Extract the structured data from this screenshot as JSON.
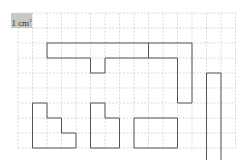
{
  "diagram": {
    "unit_label": {
      "text": "1 cm",
      "superscript": "2"
    },
    "grid": {
      "origin_x": 18,
      "origin_y": 13,
      "cell_w": 14.5,
      "cell_h": 15,
      "cols": 15,
      "rows": 9,
      "line_color": "#d0d0d0",
      "line_style": "dashed"
    },
    "shape_stroke": "#555555",
    "shapes": [
      {
        "name": "t-shape",
        "points": [
          [
            2,
            2
          ],
          [
            9,
            2
          ],
          [
            9,
            3
          ],
          [
            6,
            3
          ],
          [
            6,
            4
          ],
          [
            5,
            4
          ],
          [
            5,
            3
          ],
          [
            2,
            3
          ]
        ]
      },
      {
        "name": "l-shape-top-right",
        "points": [
          [
            9,
            2
          ],
          [
            12,
            2
          ],
          [
            12,
            6
          ],
          [
            11,
            6
          ],
          [
            11,
            3
          ],
          [
            9,
            3
          ]
        ]
      },
      {
        "name": "vertical-bar",
        "points": [
          [
            13,
            4
          ],
          [
            14,
            4
          ],
          [
            14,
            10
          ],
          [
            13,
            10
          ]
        ]
      },
      {
        "name": "staircase-left",
        "points": [
          [
            1,
            6
          ],
          [
            2,
            6
          ],
          [
            2,
            7
          ],
          [
            3,
            7
          ],
          [
            3,
            8
          ],
          [
            4,
            8
          ],
          [
            4,
            9
          ],
          [
            1,
            9
          ]
        ]
      },
      {
        "name": "step-shape",
        "points": [
          [
            5,
            6
          ],
          [
            6,
            6
          ],
          [
            6,
            7
          ],
          [
            7,
            7
          ],
          [
            7,
            9
          ],
          [
            5,
            9
          ]
        ]
      },
      {
        "name": "rectangle",
        "points": [
          [
            8,
            7
          ],
          [
            11,
            7
          ],
          [
            11,
            9
          ],
          [
            8,
            9
          ]
        ]
      }
    ]
  }
}
